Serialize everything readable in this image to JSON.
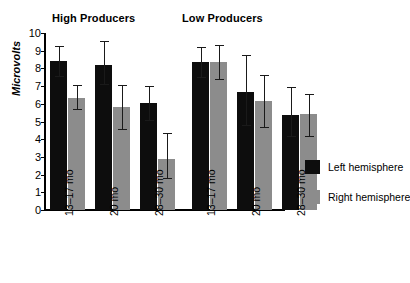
{
  "chart_data": {
    "type": "bar",
    "title": "",
    "xlabel": "",
    "ylabel": "Microvolts",
    "ylim": [
      0,
      10
    ],
    "ytick_values": [
      0,
      1,
      2,
      3,
      4,
      5,
      6,
      7,
      8,
      9,
      10
    ],
    "ytick_labels": [
      "0",
      "1",
      "2",
      "3",
      "4",
      "5",
      "6",
      "7",
      "8",
      "9",
      "10"
    ],
    "grid": false,
    "legend_position": "right",
    "panels": [
      {
        "title": "High Producers",
        "categories": [
          "13–17 mo",
          "20 mo",
          "28–30 mo"
        ],
        "series": [
          {
            "name": "Left hemisphere",
            "color": "#0d0d0d",
            "values": [
              8.4,
              8.2,
              6.05
            ],
            "err_low": [
              7.55,
              7.1,
              5.1
            ],
            "err_high": [
              9.25,
              9.55,
              7.0
            ]
          },
          {
            "name": "Right hemisphere",
            "color": "#8c8c8c",
            "values": [
              6.35,
              5.8,
              2.9
            ],
            "err_low": [
              5.7,
              4.6,
              1.8
            ],
            "err_high": [
              7.05,
              7.05,
              4.35
            ]
          }
        ]
      },
      {
        "title": "Low Producers",
        "categories": [
          "13–17 mo",
          "20 mo",
          "28–30 mo"
        ],
        "series": [
          {
            "name": "Left hemisphere",
            "color": "#0d0d0d",
            "values": [
              8.35,
              6.65,
              5.35
            ],
            "err_low": [
              7.5,
              4.8,
              4.2
            ],
            "err_high": [
              9.2,
              8.75,
              6.95
            ]
          },
          {
            "name": "Right hemisphere",
            "color": "#8c8c8c",
            "values": [
              8.35,
              6.15,
              5.45
            ],
            "err_low": [
              7.4,
              4.7,
              4.2
            ],
            "err_high": [
              9.3,
              7.6,
              6.55
            ]
          }
        ]
      }
    ],
    "legend": [
      {
        "label": "Left hemisphere",
        "color": "#0d0d0d"
      },
      {
        "label": "Right hemisphere",
        "color": "#8c8c8c"
      }
    ]
  },
  "colors": {
    "left_hemisphere": "#0d0d0d",
    "right_hemisphere": "#8c8c8c",
    "axis": "#000000",
    "background": "#ffffff"
  }
}
